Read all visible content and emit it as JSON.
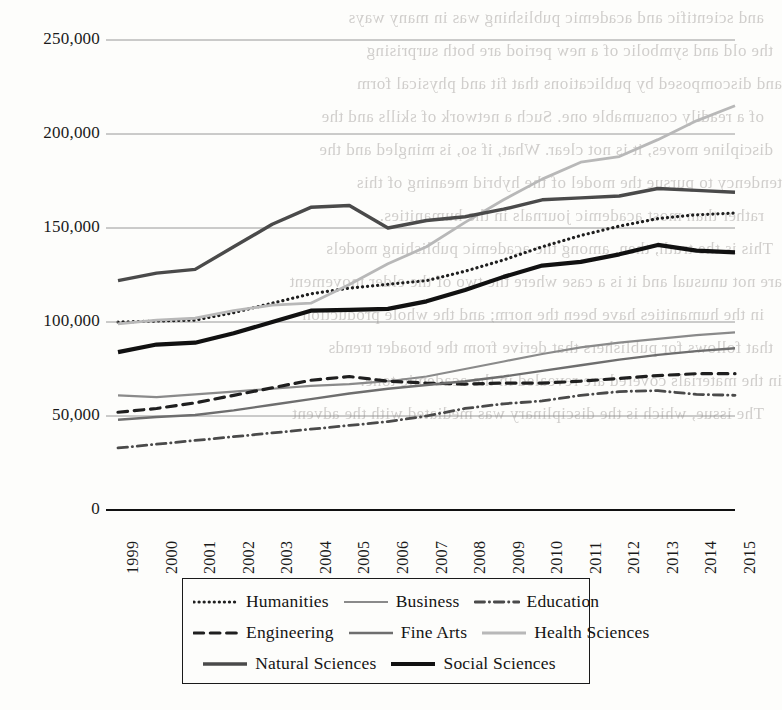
{
  "page": {
    "bleed_text": [
      "and scientific and academic publishing was in many ways",
      "the old and symbolic of a new period are both surprising",
      "and discomposed by publications that fit and physical form",
      "of a readily consumable one. Such a network of skills and the",
      "discipline moves, it is not clear. What, if so, is mingled and the",
      "tendency to pursue the model of the hybrid meaning of this",
      "rather than most academic journals in the humanities.",
      "This is the truth, then, among the academic publishing models",
      "are not unusual and it is a case where the two of the elder movement",
      "in the humanities have been the norm; and the whole production",
      "that follows for publishers that derive from the broader trends",
      "in the materials covered are revealed in the academic tone.",
      "The issue, which is the disciplinary was mediated with the advent"
    ]
  },
  "chart_data": {
    "type": "line",
    "title": "",
    "xlabel": "",
    "ylabel": "",
    "categories": [
      "1999",
      "2000",
      "2001",
      "2002",
      "2003",
      "2004",
      "2005",
      "2006",
      "2007",
      "2008",
      "2009",
      "2010",
      "2011",
      "2012",
      "2013",
      "2014",
      "2015"
    ],
    "ylim": [
      0,
      250000
    ],
    "yticks": [
      0,
      50000,
      100000,
      150000,
      200000,
      250000
    ],
    "ytick_labels": [
      "0",
      "50,000",
      "100,000",
      "150,000",
      "200,000",
      "250,000"
    ],
    "grid": "horizontal",
    "legend_position": "bottom",
    "series": [
      {
        "name": "Humanities",
        "style": "dotted",
        "color": "#1f1f1f",
        "width": 3.2,
        "values": [
          100000,
          100500,
          101000,
          105000,
          110000,
          115000,
          118000,
          120000,
          122000,
          127000,
          133000,
          140000,
          146000,
          151000,
          155000,
          157000,
          158000
        ]
      },
      {
        "name": "Business",
        "style": "solid",
        "color": "#8a8a8a",
        "width": 2.2,
        "values": [
          61000,
          60000,
          61500,
          63000,
          64500,
          66000,
          67000,
          68500,
          71000,
          75000,
          79000,
          83000,
          86500,
          89000,
          91000,
          93000,
          94500
        ]
      },
      {
        "name": "Education",
        "style": "dashdot",
        "color": "#4a4a4a",
        "width": 2.8,
        "values": [
          33000,
          35000,
          37000,
          39000,
          41000,
          43000,
          45000,
          47000,
          50000,
          54000,
          56500,
          58000,
          61000,
          63000,
          63500,
          61500,
          61000
        ]
      },
      {
        "name": "Engineering",
        "style": "dashed",
        "color": "#1f1f1f",
        "width": 3.2,
        "values": [
          52000,
          54000,
          57000,
          61000,
          65000,
          69000,
          71000,
          68500,
          67500,
          67000,
          67500,
          67500,
          68500,
          70000,
          71500,
          72500,
          72500
        ]
      },
      {
        "name": "Fine Arts",
        "style": "solid",
        "color": "#6e6e6e",
        "width": 2.4,
        "values": [
          48000,
          49500,
          50500,
          53000,
          56000,
          59000,
          62000,
          64500,
          66500,
          68500,
          71000,
          74000,
          77000,
          80000,
          82500,
          84500,
          86000
        ]
      },
      {
        "name": "Health Sciences",
        "style": "solid",
        "color": "#b8b8b8",
        "width": 2.8,
        "values": [
          99000,
          101000,
          102000,
          106000,
          109000,
          110000,
          120000,
          131000,
          140000,
          153000,
          165000,
          176000,
          185000,
          188000,
          197000,
          207000,
          215000
        ]
      },
      {
        "name": "Natural Sciences",
        "style": "solid",
        "color": "#4a4a4a",
        "width": 3.4,
        "values": [
          122000,
          126000,
          128000,
          140000,
          152000,
          161000,
          162000,
          150000,
          154000,
          156000,
          160000,
          165000,
          166000,
          167000,
          171000,
          170000,
          169000
        ]
      },
      {
        "name": "Social Sciences",
        "style": "solid",
        "color": "#111111",
        "width": 4.2,
        "values": [
          84000,
          88000,
          89000,
          94000,
          100000,
          106000,
          106500,
          107000,
          111000,
          117000,
          124000,
          130000,
          132000,
          136000,
          141000,
          138000,
          137000
        ]
      }
    ]
  },
  "legend": {
    "rows": [
      [
        {
          "label": "Humanities",
          "series": 0
        },
        {
          "label": "Business",
          "series": 1
        },
        {
          "label": "Education",
          "series": 2
        }
      ],
      [
        {
          "label": "Engineering",
          "series": 3
        },
        {
          "label": "Fine Arts",
          "series": 4
        },
        {
          "label": "Health Sciences",
          "series": 5
        }
      ],
      [
        {
          "label": "Natural Sciences",
          "series": 6
        },
        {
          "label": "Social Sciences",
          "series": 7
        }
      ]
    ]
  }
}
